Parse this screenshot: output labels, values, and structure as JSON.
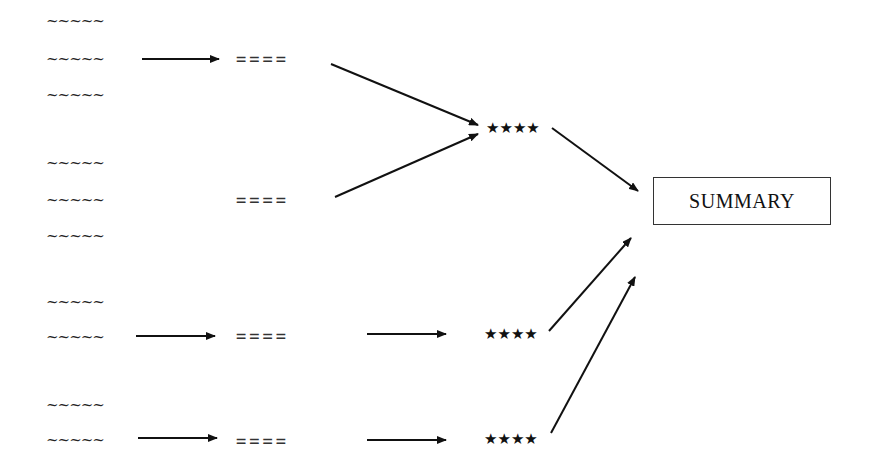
{
  "diagram": {
    "groups": [
      {
        "id": "group-1",
        "source_lines": [
          "~~~~~",
          "~~~~~",
          "~~~~~"
        ],
        "intermediate": "====",
        "has_left_arrow": true
      },
      {
        "id": "group-2",
        "source_lines": [
          "~~~~~",
          "~~~~~",
          "~~~~~"
        ],
        "intermediate": "====",
        "has_left_arrow": false
      },
      {
        "id": "group-3",
        "source_lines": [
          "~~~~~",
          "~~~~~"
        ],
        "intermediate": "====",
        "has_left_arrow": true
      },
      {
        "id": "group-4",
        "source_lines": [
          "~~~~~",
          "~~~~~"
        ],
        "intermediate": "====",
        "has_left_arrow": true
      }
    ],
    "merge_nodes": [
      {
        "id": "stars-1",
        "label": "★★★★",
        "inputs": [
          "group-1",
          "group-2"
        ]
      },
      {
        "id": "stars-2",
        "label": "★★★★",
        "inputs": [
          "group-3"
        ]
      },
      {
        "id": "stars-3",
        "label": "★★★★",
        "inputs": [
          "group-4"
        ]
      }
    ],
    "summary": {
      "label": "SUMMARY",
      "inputs": [
        "stars-1",
        "stars-2",
        "stars-3"
      ]
    },
    "colors": {
      "ink": "#111111",
      "background": "#ffffff"
    }
  }
}
